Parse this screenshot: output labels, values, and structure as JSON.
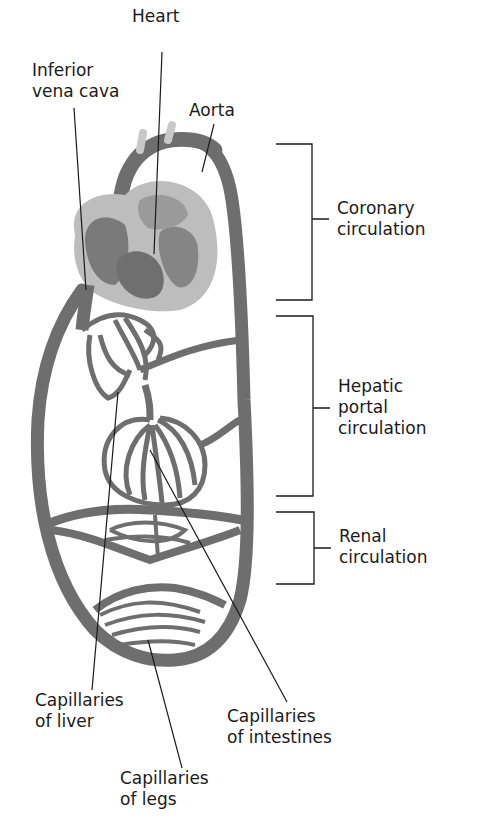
{
  "diagram": {
    "type": "circulatory-system-schematic",
    "colors": {
      "vessel": "#6e6e6e",
      "heart_outer": "#b9b9b9",
      "heart_chamber": "#7a7a7a",
      "leader_line": "#1a1a1a",
      "text": "#1a1a1a",
      "background": "#ffffff"
    },
    "labels": {
      "heart": "Heart",
      "inferior_vena_cava": [
        "Inferior",
        "vena cava"
      ],
      "aorta": "Aorta",
      "capillaries_liver": [
        "Capillaries",
        "of liver"
      ],
      "capillaries_intestines": [
        "Capillaries",
        "of intestines"
      ],
      "capillaries_legs": [
        "Capillaries",
        "of legs"
      ]
    },
    "brackets": [
      {
        "name": "coronary",
        "lines": [
          "Coronary",
          "circulation"
        ]
      },
      {
        "name": "hepatic-portal",
        "lines": [
          "Hepatic",
          "portal",
          "circulation"
        ]
      },
      {
        "name": "renal",
        "lines": [
          "Renal",
          "circulation"
        ]
      }
    ]
  }
}
